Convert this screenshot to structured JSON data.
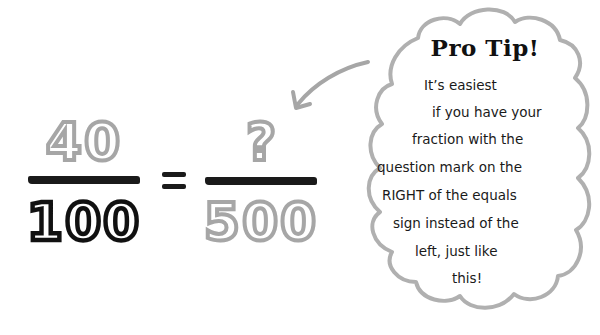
{
  "equation": {
    "left_fraction": {
      "numerator": "40",
      "denominator": "100"
    },
    "equals_sign": "=",
    "right_fraction": {
      "numerator": "?",
      "denominator": "500"
    }
  },
  "callout": {
    "title": "Pro Tip!",
    "lines": [
      "It’s easiest",
      "if you have your",
      "fraction with the",
      "question mark on the",
      "RIGHT of the equals",
      "sign instead of the",
      "left, just like",
      "this!"
    ],
    "arrow_target": "right-fraction-numerator"
  },
  "colors": {
    "highlight_gray": "#a6a6a6",
    "ink_black": "#111111",
    "cloud_outline": "#b0b0b0"
  }
}
